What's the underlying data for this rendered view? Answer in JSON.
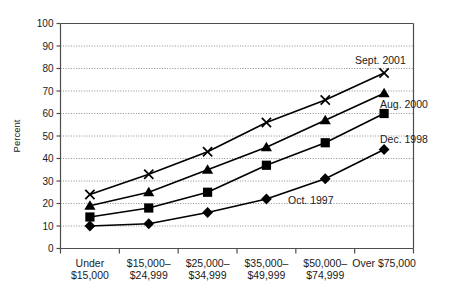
{
  "chart_data": {
    "type": "line",
    "title": "",
    "xlabel": "",
    "ylabel": "Percent",
    "ylim": [
      0,
      100
    ],
    "ytick_step": 10,
    "yticks": [
      "0",
      "10",
      "20",
      "30",
      "40",
      "50",
      "60",
      "70",
      "80",
      "90",
      "100"
    ],
    "grid": true,
    "grid_style": "dotted-horizontal",
    "legend_position": "inline-annotations-right",
    "categories": [
      "Under\n$15,000",
      "$15,000–\n$24,999",
      "$25,000–\n$34,999",
      "$35,000–\n$49,999",
      "$50,000–\n$74,999",
      "Over $75,000"
    ],
    "category_lines": [
      [
        "Under",
        "$15,000"
      ],
      [
        "$15,000–",
        "$24,999"
      ],
      [
        "$25,000–",
        "$34,999"
      ],
      [
        "$35,000–",
        "$49,999"
      ],
      [
        "$50,000–",
        "$74,999"
      ],
      [
        "Over $75,000"
      ]
    ],
    "series": [
      {
        "name": "Sept. 2001",
        "marker": "x",
        "values": [
          24,
          33,
          43,
          56,
          66,
          78
        ]
      },
      {
        "name": "Aug. 2000",
        "marker": "triangle",
        "values": [
          19,
          25,
          35,
          45,
          57,
          69
        ]
      },
      {
        "name": "Dec. 1998",
        "marker": "square",
        "values": [
          14,
          18,
          25,
          37,
          47,
          60
        ]
      },
      {
        "name": "Oct. 1997",
        "marker": "diamond",
        "values": [
          10,
          11,
          16,
          22,
          31,
          44
        ]
      }
    ],
    "annotations": [
      {
        "text": "Sept. 2001",
        "series": "Sept. 2001",
        "x": 355,
        "y": 64
      },
      {
        "text": "Aug. 2000",
        "series": "Aug. 2000",
        "x": 380,
        "y": 108
      },
      {
        "text": "Dec. 1998",
        "series": "Dec. 1998",
        "x": 380,
        "y": 143
      },
      {
        "text": "Oct. 1997",
        "series": "Oct. 1997",
        "x": 288,
        "y": 204
      }
    ],
    "colors": {
      "line": "#000000",
      "marker": "#000000",
      "grid": "#8c8c8c",
      "axis": "#4d4d4d",
      "background": "#ffffff",
      "text": "#1a1a1a"
    }
  }
}
